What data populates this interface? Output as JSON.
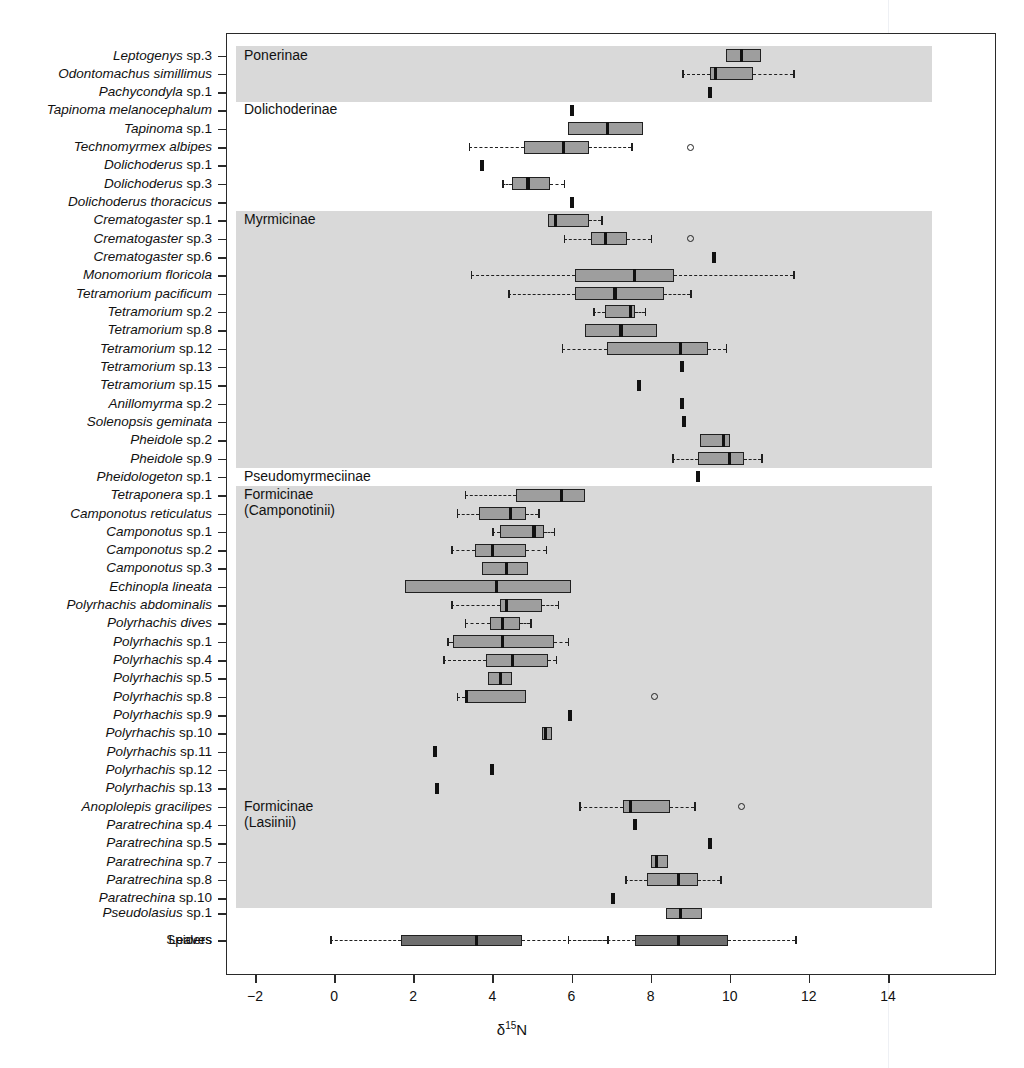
{
  "chart_data": {
    "type": "box",
    "title": "",
    "xlabel": "δ15N",
    "xlabel_parts": {
      "delta": "δ",
      "sup": "15",
      "element": "N"
    },
    "ylabel": "",
    "xlim": [
      -2.6,
      16.8
    ],
    "xticks": [
      -2,
      0,
      2,
      4,
      6,
      8,
      10,
      12,
      14
    ],
    "xticklabels": [
      "−2",
      "0",
      "2",
      "4",
      "6",
      "8",
      "10",
      "12",
      "14"
    ],
    "grid": false,
    "legend": null,
    "orientation": "horizontal",
    "groups": [
      {
        "name": "Ponerinae",
        "shaded": true,
        "first": 0,
        "last": 2
      },
      {
        "name": "Dolichoderinae",
        "shaded": false,
        "first": 3,
        "last": 8
      },
      {
        "name": "Myrmicinae",
        "shaded": true,
        "first": 9,
        "last": 22
      },
      {
        "name": "Pseudomyrmeciinae",
        "shaded": false,
        "first": 23,
        "last": 23
      },
      {
        "name": "Formicinae\n(Camponotinii)",
        "shaded": true,
        "first": 24,
        "last": 40
      },
      {
        "name": "Formicinae\n(Lasiinii)",
        "shaded": true,
        "first": 41,
        "last": 46
      },
      {
        "name": "",
        "shaded": false,
        "first": 47,
        "last": 48
      }
    ],
    "boxes": [
      {
        "label": "Leptogenys sp.3",
        "italic": true,
        "min": 9.9,
        "q1": 9.9,
        "med": 10.3,
        "q3": 10.8,
        "max": 10.8,
        "whiskers": false,
        "outliers": [],
        "style": "light"
      },
      {
        "label": "Odontomachus simillimus",
        "italic": true,
        "min": 8.8,
        "q1": 9.5,
        "med": 9.65,
        "q3": 10.6,
        "max": 11.6,
        "whiskers": true,
        "outliers": [],
        "style": "light"
      },
      {
        "label": "Pachycondyla sp.1",
        "italic": true,
        "single": 9.5,
        "style": "single"
      },
      {
        "label": "Tapinoma melanocephalum",
        "italic": true,
        "single": 6.0,
        "style": "single"
      },
      {
        "label": "Tapinoma sp.1",
        "italic": true,
        "min": 5.9,
        "q1": 5.9,
        "med": 6.9,
        "q3": 7.8,
        "max": 7.8,
        "whiskers": false,
        "outliers": [],
        "style": "light"
      },
      {
        "label": "Technomyrmex albipes",
        "italic": true,
        "min": 3.4,
        "q1": 4.8,
        "med": 5.8,
        "q3": 6.45,
        "max": 7.5,
        "whiskers": true,
        "outliers": [
          9.0
        ],
        "style": "light"
      },
      {
        "label": "Dolichoderus sp.1",
        "italic": true,
        "single": 3.75,
        "style": "single"
      },
      {
        "label": "Dolichoderus sp.3",
        "italic": true,
        "min": 4.25,
        "q1": 4.5,
        "med": 4.9,
        "q3": 5.45,
        "max": 5.8,
        "whiskers": true,
        "outliers": [],
        "style": "light"
      },
      {
        "label": "Dolichoderus thoracicus",
        "italic": true,
        "single": 6.0,
        "style": "single"
      },
      {
        "label": "Crematogaster sp.1",
        "italic": true,
        "min": 5.4,
        "q1": 5.4,
        "med": 5.6,
        "q3": 6.45,
        "max": 6.75,
        "whiskers": true,
        "outliers": [],
        "style": "light"
      },
      {
        "label": "Crematogaster sp.3",
        "italic": true,
        "min": 5.8,
        "q1": 6.5,
        "med": 6.85,
        "q3": 7.4,
        "max": 8.0,
        "whiskers": true,
        "outliers": [
          9.0
        ],
        "style": "light"
      },
      {
        "label": "Crematogaster sp.6",
        "italic": true,
        "single": 9.6,
        "style": "single"
      },
      {
        "label": "Monomorium floricola",
        "italic": true,
        "min": 3.45,
        "q1": 6.1,
        "med": 7.6,
        "q3": 8.6,
        "max": 11.6,
        "whiskers": true,
        "outliers": [],
        "style": "light"
      },
      {
        "label": "Tetramorium pacificum",
        "italic": true,
        "min": 4.4,
        "q1": 6.1,
        "med": 7.1,
        "q3": 8.35,
        "max": 9.0,
        "whiskers": true,
        "outliers": [],
        "style": "light"
      },
      {
        "label": "Tetramorium sp.2",
        "italic": true,
        "min": 6.55,
        "q1": 6.85,
        "med": 7.5,
        "q3": 7.6,
        "max": 7.85,
        "whiskers": true,
        "outliers": [],
        "style": "light"
      },
      {
        "label": "Tetramorium sp.8",
        "italic": true,
        "min": 6.35,
        "q1": 6.35,
        "med": 7.25,
        "q3": 8.15,
        "max": 8.15,
        "whiskers": false,
        "outliers": [],
        "style": "light"
      },
      {
        "label": "Tetramorium sp.12",
        "italic": true,
        "min": 5.75,
        "q1": 6.9,
        "med": 8.75,
        "q3": 9.45,
        "max": 9.9,
        "whiskers": true,
        "outliers": [],
        "style": "light"
      },
      {
        "label": "Tetramorium sp.13",
        "italic": true,
        "single": 8.8,
        "style": "single"
      },
      {
        "label": "Tetramorium sp.15",
        "italic": true,
        "single": 7.7,
        "style": "single"
      },
      {
        "label": "Anillomyrma sp.2",
        "italic": true,
        "single": 8.8,
        "style": "single"
      },
      {
        "label": "Solenopsis geminata",
        "italic": true,
        "single": 8.85,
        "style": "single"
      },
      {
        "label": "Pheidole sp.2",
        "italic": true,
        "min": 9.25,
        "q1": 9.25,
        "med": 9.85,
        "q3": 10.0,
        "max": 10.0,
        "whiskers": false,
        "outliers": [],
        "style": "light"
      },
      {
        "label": "Pheidole sp.9",
        "italic": true,
        "min": 8.55,
        "q1": 9.2,
        "med": 10.0,
        "q3": 10.35,
        "max": 10.8,
        "whiskers": true,
        "outliers": [],
        "style": "light"
      },
      {
        "label": "Pheidologeton sp.1",
        "italic": true,
        "single": 9.2,
        "style": "single"
      },
      {
        "label": "Tetraponera sp.1",
        "italic": true,
        "min": 3.3,
        "q1": 4.6,
        "med": 5.75,
        "q3": 6.35,
        "max": 6.35,
        "whiskers": true,
        "outliers": [],
        "style": "light"
      },
      {
        "label": "Camponotus reticulatus",
        "italic": true,
        "min": 3.1,
        "q1": 3.65,
        "med": 4.45,
        "q3": 4.85,
        "max": 5.15,
        "whiskers": true,
        "outliers": [],
        "style": "light"
      },
      {
        "label": "Camponotus sp.1",
        "italic": true,
        "min": 4.0,
        "q1": 4.2,
        "med": 5.05,
        "q3": 5.3,
        "max": 5.55,
        "whiskers": true,
        "outliers": [],
        "style": "light"
      },
      {
        "label": "Camponotus sp.2",
        "italic": true,
        "min": 2.95,
        "q1": 3.55,
        "med": 4.0,
        "q3": 4.85,
        "max": 5.35,
        "whiskers": true,
        "outliers": [],
        "style": "light"
      },
      {
        "label": "Camponotus sp.3",
        "italic": true,
        "min": 3.75,
        "q1": 3.75,
        "med": 4.35,
        "q3": 4.9,
        "max": 4.9,
        "whiskers": false,
        "outliers": [],
        "style": "light"
      },
      {
        "label": "Echinopla lineata",
        "italic": true,
        "min": 1.8,
        "q1": 1.8,
        "med": 4.1,
        "q3": 6.0,
        "max": 6.0,
        "whiskers": false,
        "outliers": [],
        "style": "light"
      },
      {
        "label": "Polyrhachis abdominalis",
        "italic": true,
        "min": 2.95,
        "q1": 4.2,
        "med": 4.35,
        "q3": 5.25,
        "max": 5.65,
        "whiskers": true,
        "outliers": [],
        "style": "light"
      },
      {
        "label": "Polyrhachis dives",
        "italic": true,
        "min": 3.3,
        "q1": 3.95,
        "med": 4.25,
        "q3": 4.7,
        "max": 4.95,
        "whiskers": true,
        "outliers": [],
        "style": "light"
      },
      {
        "label": "Polyrhachis sp.1",
        "italic": true,
        "min": 2.85,
        "q1": 3.0,
        "med": 4.25,
        "q3": 5.55,
        "max": 5.9,
        "whiskers": true,
        "outliers": [],
        "style": "light"
      },
      {
        "label": "Polyrhachis sp.4",
        "italic": true,
        "min": 2.75,
        "q1": 3.85,
        "med": 4.5,
        "q3": 5.4,
        "max": 5.6,
        "whiskers": true,
        "outliers": [],
        "style": "light"
      },
      {
        "label": "Polyrhachis sp.5",
        "italic": true,
        "min": 3.9,
        "q1": 3.9,
        "med": 4.2,
        "q3": 4.5,
        "max": 4.5,
        "whiskers": false,
        "outliers": [],
        "style": "light"
      },
      {
        "label": "Polyrhachis sp.8",
        "italic": true,
        "min": 3.1,
        "q1": 3.3,
        "med": 3.35,
        "q3": 4.85,
        "max": 4.85,
        "whiskers": true,
        "outliers": [
          8.1
        ],
        "style": "light"
      },
      {
        "label": "Polyrhachis sp.9",
        "italic": true,
        "single": 5.95,
        "style": "single"
      },
      {
        "label": "Polyrhachis sp.10",
        "italic": true,
        "min": 5.25,
        "q1": 5.25,
        "med": 5.35,
        "q3": 5.5,
        "max": 5.5,
        "whiskers": false,
        "outliers": [],
        "style": "light"
      },
      {
        "label": "Polyrhachis sp.11",
        "italic": true,
        "single": 2.55,
        "style": "single"
      },
      {
        "label": "Polyrhachis sp.12",
        "italic": true,
        "single": 4.0,
        "style": "single"
      },
      {
        "label": "Polyrhachis sp.13",
        "italic": true,
        "single": 2.6,
        "style": "single"
      },
      {
        "label": "Anoplolepis gracilipes",
        "italic": true,
        "min": 6.2,
        "q1": 7.3,
        "med": 7.5,
        "q3": 8.5,
        "max": 9.1,
        "whiskers": true,
        "outliers": [
          10.3
        ],
        "style": "light"
      },
      {
        "label": "Paratrechina sp.4",
        "italic": true,
        "single": 7.6,
        "style": "single"
      },
      {
        "label": "Paratrechina sp.5",
        "italic": true,
        "single": 9.5,
        "style": "single"
      },
      {
        "label": "Paratrechina sp.7",
        "italic": true,
        "min": 8.0,
        "q1": 8.0,
        "med": 8.15,
        "q3": 8.45,
        "max": 8.45,
        "whiskers": false,
        "outliers": [],
        "style": "light"
      },
      {
        "label": "Paratrechina sp.8",
        "italic": true,
        "min": 7.35,
        "q1": 7.9,
        "med": 8.7,
        "q3": 9.2,
        "max": 9.75,
        "whiskers": true,
        "outliers": [],
        "style": "light"
      },
      {
        "label": "Paratrechina sp.10",
        "italic": true,
        "single": 7.05,
        "style": "single"
      },
      {
        "label": "Pseudolasius sp.1",
        "italic": true,
        "min": 8.4,
        "q1": 8.4,
        "med": 8.75,
        "q3": 9.3,
        "max": 9.3,
        "whiskers": false,
        "outliers": [],
        "style": "light"
      },
      {
        "label": "Spiders",
        "italic": false,
        "min": 5.9,
        "q1": 7.6,
        "med": 8.7,
        "q3": 9.95,
        "max": 11.65,
        "whiskers": true,
        "outliers": [],
        "style": "dark"
      },
      {
        "label": "Leaves",
        "italic": false,
        "min": -0.1,
        "q1": 1.7,
        "med": 3.6,
        "q3": 4.75,
        "max": 6.9,
        "whiskers": true,
        "outliers": [],
        "style": "dark"
      }
    ]
  },
  "axis": {
    "x_title_delta": "δ",
    "x_title_sup": "15",
    "x_title_el": "N"
  }
}
